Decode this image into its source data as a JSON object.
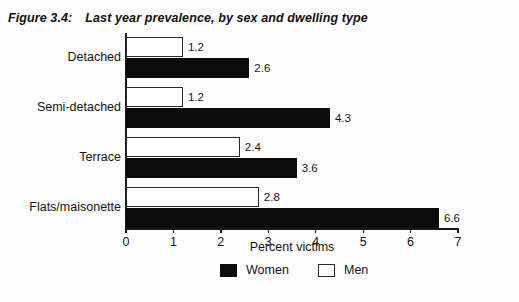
{
  "figure": {
    "number": "Figure 3.4:",
    "title": "Last year prevalence, by sex and dwelling type"
  },
  "chart_data": {
    "type": "bar",
    "orientation": "horizontal",
    "title": "Last year prevalence, by sex and dwelling type",
    "subtitle": "",
    "categories": [
      "Detached",
      "Semi-detached",
      "Terrace",
      "Flats/maisonette"
    ],
    "series": [
      {
        "name": "Women",
        "color": "#0b0b0b",
        "values": [
          2.6,
          4.3,
          3.6,
          6.6
        ]
      },
      {
        "name": "Men",
        "color": "#ffffff",
        "values": [
          1.2,
          1.2,
          2.4,
          2.8
        ]
      }
    ],
    "series_order_top_to_bottom": [
      "Men",
      "Women"
    ],
    "xlabel": "Percent victims",
    "ylabel": "",
    "xlim": [
      0,
      7
    ],
    "xticks": [
      0,
      1,
      2,
      3,
      4,
      5,
      6,
      7
    ],
    "xtick_labels": [
      "0",
      "1",
      "2",
      "3",
      "4",
      "5",
      "6",
      "7"
    ],
    "grid": false,
    "legend_position": "bottom",
    "data_labels": [
      "1.2",
      "2.6",
      "1.2",
      "4.3",
      "2.4",
      "3.6",
      "2.8",
      "6.6"
    ]
  },
  "legend": {
    "items": [
      {
        "label": "Women",
        "swatch": "black"
      },
      {
        "label": "Men",
        "swatch": "white"
      }
    ]
  }
}
